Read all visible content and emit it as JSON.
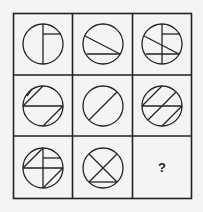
{
  "puzzle": {
    "rows": 3,
    "cols": 3,
    "question_mark": "?",
    "colors": {
      "stroke": "#222222",
      "background": "#f4f4f4"
    },
    "cells": [
      {
        "row": 0,
        "col": 0,
        "description": "circle with vertical diameter and short horizontal line from center-top to right edge"
      },
      {
        "row": 0,
        "col": 1,
        "description": "circle with descending diagonal chord and horizontal chord near bottom"
      },
      {
        "row": 0,
        "col": 2,
        "description": "overlay of cells 1 and 2"
      },
      {
        "row": 1,
        "col": 0,
        "description": "circle with horizontal diameter and two parallel diagonal chords"
      },
      {
        "row": 1,
        "col": 1,
        "description": "circle with ascending diagonal diameter"
      },
      {
        "row": 1,
        "col": 2,
        "description": "overlay of cells 1 and 2"
      },
      {
        "row": 2,
        "col": 0,
        "description": "circle with cross, short horizontal line, and two diagonal chords"
      },
      {
        "row": 2,
        "col": 1,
        "description": "circle with X and horizontal chord near bottom"
      },
      {
        "row": 2,
        "col": 2,
        "description": "unknown",
        "label": "?"
      }
    ]
  }
}
